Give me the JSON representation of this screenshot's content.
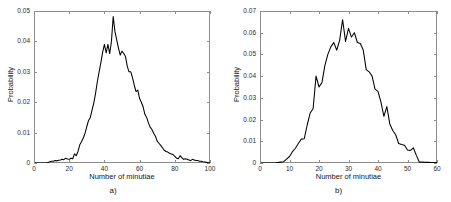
{
  "figure": {
    "panels": [
      {
        "id": "a",
        "panel_label": "a)",
        "xlabel": "Number of minutiae",
        "ylabel": "Probability"
      },
      {
        "id": "b",
        "panel_label": "b)",
        "xlabel": "Number of minutiae",
        "ylabel": "Probability"
      }
    ],
    "caption_partial": ""
  },
  "chart_data": [
    {
      "type": "line",
      "id": "panel-a",
      "title": "",
      "panel_label": "a)",
      "xlabel": "Number of minutiae",
      "ylabel": "Probability",
      "xlim": [
        0,
        100
      ],
      "ylim": [
        0,
        0.05
      ],
      "xticks": [
        0,
        20,
        40,
        60,
        80,
        100
      ],
      "xtick_labels": [
        "0",
        "20",
        "40",
        "60",
        "80",
        "100"
      ],
      "yticks": [
        0,
        0.01,
        0.02,
        0.03,
        0.04,
        0.05
      ],
      "ytick_labels": [
        "0",
        "0.01",
        "0.02",
        "0.03",
        "0.04",
        "0.05"
      ],
      "grid": false,
      "legend": null,
      "line_color": "#000000",
      "x": [
        0,
        1,
        2,
        3,
        4,
        5,
        6,
        7,
        8,
        9,
        10,
        11,
        12,
        13,
        14,
        15,
        16,
        17,
        18,
        19,
        20,
        21,
        22,
        23,
        24,
        25,
        26,
        27,
        28,
        29,
        30,
        31,
        32,
        33,
        34,
        35,
        36,
        37,
        38,
        39,
        40,
        41,
        42,
        43,
        44,
        45,
        46,
        47,
        48,
        49,
        50,
        51,
        52,
        53,
        54,
        55,
        56,
        57,
        58,
        59,
        60,
        61,
        62,
        63,
        64,
        65,
        66,
        67,
        68,
        69,
        70,
        71,
        72,
        73,
        74,
        75,
        76,
        77,
        78,
        79,
        80,
        81,
        82,
        83,
        84,
        85,
        86,
        87,
        88,
        89,
        90,
        91,
        92,
        93,
        94,
        95,
        96,
        97,
        98,
        99,
        100
      ],
      "y": [
        0,
        0,
        0,
        0,
        0,
        0,
        0,
        0,
        0.0002,
        0.0004,
        0.0006,
        0.0006,
        0.0008,
        0.0007,
        0.0009,
        0.001,
        0.0012,
        0.0011,
        0.0016,
        0.0013,
        0.0012,
        0.0016,
        0.0014,
        0.003,
        0.0024,
        0.0038,
        0.006,
        0.007,
        0.0082,
        0.0098,
        0.012,
        0.014,
        0.015,
        0.0175,
        0.0198,
        0.023,
        0.0268,
        0.03,
        0.033,
        0.0365,
        0.039,
        0.0362,
        0.039,
        0.036,
        0.04,
        0.0482,
        0.0432,
        0.0405,
        0.0378,
        0.0355,
        0.0368,
        0.036,
        0.035,
        0.0318,
        0.03,
        0.03,
        0.028,
        0.0255,
        0.0235,
        0.024,
        0.0212,
        0.02,
        0.0185,
        0.016,
        0.015,
        0.0132,
        0.0118,
        0.011,
        0.0098,
        0.0088,
        0.0072,
        0.0065,
        0.0058,
        0.005,
        0.0042,
        0.0038,
        0.0036,
        0.0032,
        0.003,
        0.0028,
        0.0022,
        0.0016,
        0.0014,
        0.0024,
        0.0018,
        0.0012,
        0.0014,
        0.0012,
        0.001,
        0.0008,
        0.0012,
        0.001,
        0.0008,
        0.0008,
        0.0006,
        0.0006,
        0.0004,
        0.0003,
        0.0002,
        0.0001,
        0.0001
      ]
    },
    {
      "type": "line",
      "id": "panel-b",
      "title": "",
      "panel_label": "b)",
      "xlabel": "Number of minutiae",
      "ylabel": "Probability",
      "xlim": [
        0,
        60
      ],
      "ylim": [
        0,
        0.07
      ],
      "xticks": [
        0,
        10,
        20,
        30,
        40,
        50,
        60
      ],
      "xtick_labels": [
        "0",
        "10",
        "20",
        "30",
        "40",
        "50",
        "60"
      ],
      "yticks": [
        0,
        0.01,
        0.02,
        0.03,
        0.04,
        0.05,
        0.06,
        0.07
      ],
      "ytick_labels": [
        "0",
        "0.01",
        "0.02",
        "0.03",
        "0.04",
        "0.05",
        "0.06",
        "0.07"
      ],
      "grid": false,
      "legend": null,
      "line_color": "#000000",
      "x": [
        0,
        1,
        2,
        3,
        4,
        5,
        6,
        7,
        8,
        9,
        10,
        11,
        12,
        13,
        14,
        15,
        16,
        17,
        18,
        19,
        20,
        21,
        22,
        23,
        24,
        25,
        26,
        27,
        28,
        29,
        30,
        31,
        32,
        33,
        34,
        35,
        36,
        37,
        38,
        39,
        40,
        41,
        42,
        43,
        44,
        45,
        46,
        47,
        48,
        49,
        50,
        51,
        52,
        53,
        54,
        55,
        56,
        57,
        58,
        59,
        60
      ],
      "y": [
        0,
        0,
        0,
        0,
        0,
        0,
        0.0002,
        0.0004,
        0.0006,
        0.0018,
        0.003,
        0.0052,
        0.0068,
        0.009,
        0.011,
        0.0112,
        0.0175,
        0.023,
        0.025,
        0.04,
        0.035,
        0.037,
        0.045,
        0.05,
        0.0535,
        0.0555,
        0.052,
        0.0565,
        0.066,
        0.056,
        0.062,
        0.058,
        0.06,
        0.0555,
        0.055,
        0.052,
        0.043,
        0.042,
        0.04,
        0.034,
        0.033,
        0.028,
        0.0215,
        0.026,
        0.018,
        0.015,
        0.013,
        0.009,
        0.0085,
        0.0082,
        0.006,
        0.0058,
        0.007,
        0.0035,
        0.0005,
        0.0004,
        0.0003,
        0.0003,
        0.0002,
        0.0002,
        0.0002
      ]
    }
  ]
}
